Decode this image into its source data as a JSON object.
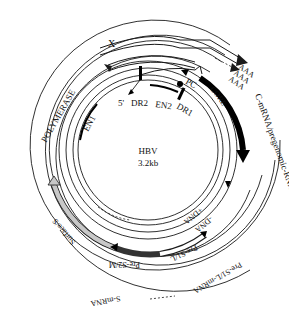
{
  "title": "HBV",
  "size": "3.2kb",
  "genes": {
    "x": "X",
    "core": "CORE",
    "polymerase": "POLYMERASE",
    "surface": "Surface/S",
    "pre_s2": "Pre-S2/M",
    "pre_s1": "Pre-S1/L"
  },
  "elements": {
    "dr1": "DR1",
    "dr2": "DR2",
    "en1": "EN1",
    "en2": "EN2",
    "pc": "PC",
    "five_prime": "5'"
  },
  "strands": {
    "minus_dna": "-DNA",
    "plus_dna": "+DNA"
  },
  "transcripts": {
    "c_mrna": "C-mRNA/pregenomic-RNA",
    "pre_s1_mrna": "Pre-S1/L-mRNA",
    "s_mrna": "S-mRNA",
    "polya": "AAA"
  },
  "colors": {
    "line": "#1a1a1a",
    "core_fill": "#000000",
    "pre_s2_fill": "#555555",
    "surface_fill": "#c8c8c8"
  }
}
